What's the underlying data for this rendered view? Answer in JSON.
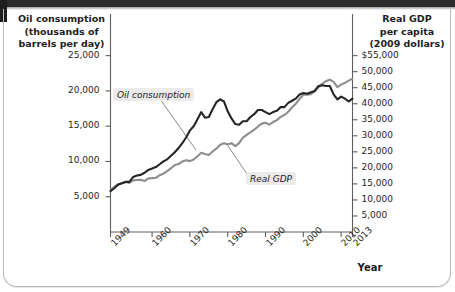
{
  "figure": {
    "left_axis_title": "Oil consumption\n(thousands of\nbarrels per day)",
    "left_axis_title_lines": [
      "Oil consumption",
      "(thousands of",
      "barrels per day)"
    ],
    "right_axis_title_lines": [
      "Real GDP",
      "per capita",
      "(2009 dollars)"
    ],
    "x_axis_title": "Year"
  },
  "labels": {
    "oil": "Oil consumption",
    "gdp": "Real GDP"
  },
  "colors": {
    "oil_line": "#252525",
    "gdp_line": "#8d8d8d",
    "axis": "#5e5e5e",
    "text": "#1d1d1d",
    "callout_bg": "#eceaea",
    "frame": "#b9b9b9"
  },
  "chart_data": {
    "type": "line",
    "title": "",
    "subtitle": "",
    "xlabel": "Year",
    "ylabel": "Oil consumption (thousands of barrels per day)",
    "y2label": "Real GDP per capita (2009 dollars)",
    "grid": false,
    "legend": "inline-annotations",
    "xlim": [
      1949,
      2013
    ],
    "xticks": [
      1949,
      1960,
      1970,
      1980,
      1990,
      2000,
      2010,
      2013
    ],
    "xticklabels": [
      "1949",
      "1960",
      "1970",
      "1980",
      "1990",
      "2000",
      "2010",
      "2013"
    ],
    "ylim": [
      0,
      27500
    ],
    "yticks": [
      5000,
      10000,
      15000,
      20000,
      25000
    ],
    "yticklabels": [
      "5,000",
      "10,000",
      "15,000",
      "20,000",
      "25,000"
    ],
    "y2lim": [
      0,
      60500
    ],
    "y2ticks": [
      5000,
      10000,
      15000,
      20000,
      25000,
      30000,
      35000,
      40000,
      45000,
      50000,
      55000
    ],
    "y2ticklabels": [
      "5,000",
      "10,000",
      "15,000",
      "20,000",
      "25,000",
      "30,000",
      "35,000",
      "40,000",
      "45,000",
      "50,000",
      "$55,000"
    ],
    "x": [
      1949,
      1950,
      1951,
      1952,
      1953,
      1954,
      1955,
      1956,
      1957,
      1958,
      1959,
      1960,
      1961,
      1962,
      1963,
      1964,
      1965,
      1966,
      1967,
      1968,
      1969,
      1970,
      1971,
      1972,
      1973,
      1974,
      1975,
      1976,
      1977,
      1978,
      1979,
      1980,
      1981,
      1982,
      1983,
      1984,
      1985,
      1986,
      1987,
      1988,
      1989,
      1990,
      1991,
      1992,
      1993,
      1994,
      1995,
      1996,
      1997,
      1998,
      1999,
      2000,
      2001,
      2002,
      2003,
      2004,
      2005,
      2006,
      2007,
      2008,
      2009,
      2010,
      2011,
      2012,
      2013
    ],
    "series": [
      {
        "name": "Oil consumption",
        "axis": "left",
        "units": "thousands of barrels per day",
        "color": "#252525",
        "values": [
          5800,
          6200,
          6700,
          6900,
          7100,
          7100,
          7800,
          8000,
          8100,
          8400,
          8800,
          9000,
          9200,
          9600,
          10000,
          10300,
          10800,
          11300,
          11900,
          12600,
          13400,
          14400,
          15000,
          16000,
          17000,
          16200,
          16300,
          17400,
          18400,
          18800,
          18500,
          17100,
          16100,
          15300,
          15200,
          15700,
          15700,
          16300,
          16700,
          17300,
          17300,
          17000,
          16700,
          17000,
          17200,
          17700,
          17700,
          18300,
          18600,
          18900,
          19500,
          19700,
          19600,
          19800,
          20000,
          20700,
          20800,
          20700,
          20700,
          19500,
          18800,
          19200,
          18900,
          18500,
          18900
        ],
        "endpoint_value": 18900
      },
      {
        "name": "Real GDP per capita",
        "axis": "right",
        "units": "2009 dollars",
        "color": "#8d8d8d",
        "values": [
          13100,
          14100,
          14900,
          15200,
          15700,
          15300,
          16100,
          16200,
          16300,
          15900,
          16700,
          16800,
          16900,
          17700,
          18200,
          19000,
          19900,
          20900,
          21200,
          22000,
          22400,
          22100,
          22600,
          23600,
          24700,
          24300,
          24000,
          25100,
          26000,
          27200,
          27700,
          27300,
          27700,
          26800,
          27700,
          29400,
          30300,
          31100,
          31900,
          32900,
          33800,
          34100,
          33500,
          34300,
          34900,
          35900,
          36500,
          37500,
          38800,
          40000,
          41500,
          42800,
          42800,
          43000,
          43900,
          45100,
          46200,
          47100,
          47500,
          46800,
          45200,
          46000,
          46500,
          47200,
          47800
        ],
        "endpoint_value": 47800
      }
    ]
  }
}
